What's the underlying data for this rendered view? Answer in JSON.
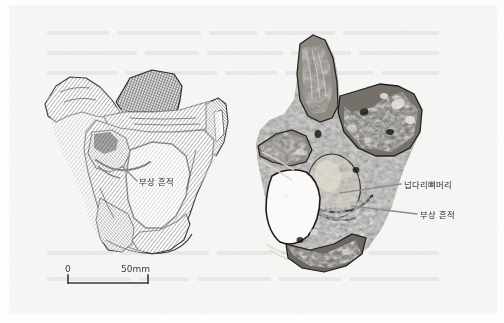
{
  "figure": {
    "caption_present": false,
    "background_color": "#f7f7f6",
    "page_color": "#ffffff",
    "ink_color": "#2c2c2c",
    "leader_line_color": "#8d8d8d"
  },
  "specimens": [
    {
      "id": "left-specimen",
      "name": "pelvis-line-drawing",
      "style": "cross-hatched line drawing",
      "description": "Hatched engraving-style drawing of a hominin pelvis with sacrum",
      "labels": [
        {
          "key": "injury_mark",
          "text": "부상 흔적",
          "x": 139,
          "y": 183
        }
      ]
    },
    {
      "id": "right-specimen",
      "name": "pelvis-photograph",
      "style": "stippled photographic rendering",
      "description": "Dark tonal rendering of the fossil pelvis specimen",
      "labels": [
        {
          "key": "femoral_head",
          "text": "넙다리뼈머리",
          "x": 404,
          "y": 186
        },
        {
          "key": "injury_mark",
          "text": "부상 흔적",
          "x": 420,
          "y": 216
        }
      ]
    }
  ],
  "scale_bar": {
    "name": "scale-bar",
    "start_label": "0",
    "end_label": "50mm",
    "unit": "mm",
    "length_value": 50,
    "bar_left_px": 68,
    "bar_right_px": 148,
    "bar_y_px": 283
  }
}
